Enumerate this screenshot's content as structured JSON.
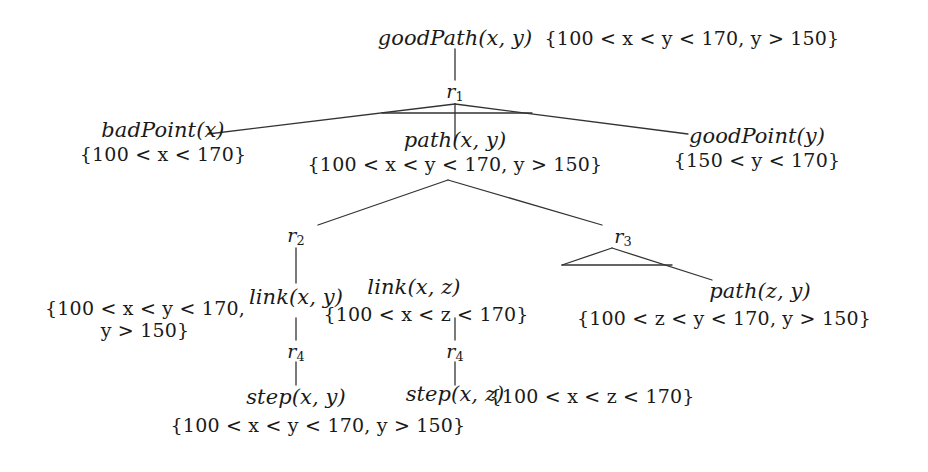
{
  "diagram": {
    "type": "derivation-tree",
    "title": "",
    "nodes": {
      "goodPath": {
        "atom": "goodPath(x, y)"
      },
      "root_constraint": {
        "text": "{100 < x < y < 170, y > 150}"
      },
      "r1": {
        "label": "r",
        "sub": "1"
      },
      "badPoint": {
        "atom": "badPoint(x)",
        "constraint": "{100 < x < 170}"
      },
      "path_xy": {
        "atom": "path(x, y)",
        "constraint": "{100 < x < y < 170, y > 150}"
      },
      "goodPoint": {
        "atom": "goodPoint(y)",
        "constraint": "{150 < y < 170}"
      },
      "r2": {
        "label": "r",
        "sub": "2"
      },
      "r3": {
        "label": "r",
        "sub": "3"
      },
      "link_xy": {
        "atom": "link(x, y)"
      },
      "link_xy_constraint": {
        "line1": "{100 < x < y < 170,",
        "line2": "y > 150}"
      },
      "link_xz": {
        "atom": "link(x, z)",
        "constraint": "{100 < x < z < 170}"
      },
      "path_zy": {
        "atom": "path(z, y)",
        "constraint": "{100 < z < y < 170, y > 150}"
      },
      "r4_left": {
        "label": "r",
        "sub": "4"
      },
      "r4_right": {
        "label": "r",
        "sub": "4"
      },
      "step_xy": {
        "atom": "step(x, y)",
        "constraint": "{100 < x < y < 170, y > 150}"
      },
      "step_xz": {
        "atom": "step(x, z)",
        "constraint": "{100 < x < z < 170}"
      }
    },
    "colors": {
      "edge": "#333333",
      "text": "#1a1a1a",
      "background": "#ffffff"
    }
  }
}
